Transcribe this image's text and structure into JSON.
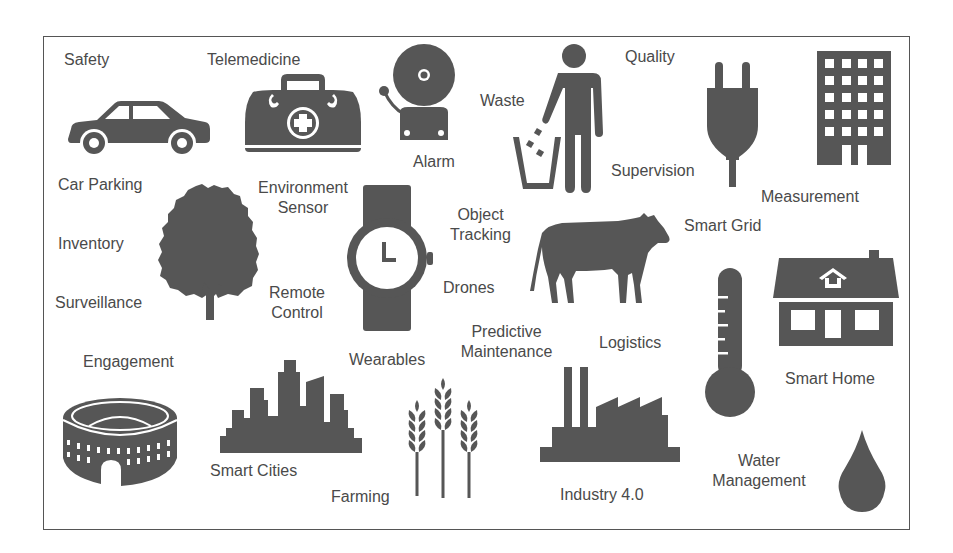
{
  "diagram": {
    "title": "",
    "frame_color": "#555555",
    "icon_color": "#565656",
    "text_color": "#4a4a4a",
    "labels": {
      "safety": "Safety",
      "telemedicine": "Telemedicine",
      "alarm": "Alarm",
      "waste": "Waste",
      "quality": "Quality",
      "supervision": "Supervision",
      "measurement": "Measurement",
      "car_parking": "Car Parking",
      "environment_sensor_1": "Environment",
      "environment_sensor_2": "Sensor",
      "inventory": "Inventory",
      "surveillance": "Surveillance",
      "remote_control_1": "Remote",
      "remote_control_2": "Control",
      "object_tracking_1": "Object",
      "object_tracking_2": "Tracking",
      "drones": "Drones",
      "smart_grid": "Smart Grid",
      "predictive_maintenance_1": "Predictive",
      "predictive_maintenance_2": "Maintenance",
      "logistics": "Logistics",
      "wearables": "Wearables",
      "engagement": "Engagement",
      "smart_home": "Smart Home",
      "smart_cities": "Smart Cities",
      "farming": "Farming",
      "industry": "Industry 4.0",
      "water_management_1": "Water",
      "water_management_2": "Management"
    },
    "icons": [
      "car-icon",
      "medical-bag-icon",
      "alarm-bell-icon",
      "person-trash-icon",
      "plug-icon",
      "office-building-icon",
      "tree-icon",
      "wristwatch-icon",
      "cow-icon",
      "thermometer-icon",
      "house-icon",
      "colosseum-icon",
      "city-skyline-icon",
      "wheat-icon",
      "factory-icon",
      "water-drop-icon"
    ]
  }
}
